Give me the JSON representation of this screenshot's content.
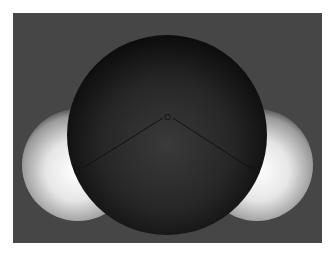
{
  "diagram": {
    "atoms": [
      {
        "id": "O",
        "label": "O",
        "element": "oxygen",
        "color": "#1a1a1a"
      },
      {
        "id": "H1",
        "label": "H",
        "element": "hydrogen",
        "color": "#f2f2f2"
      },
      {
        "id": "H2",
        "label": "H",
        "element": "hydrogen",
        "color": "#f2f2f2"
      }
    ],
    "bonds": [
      {
        "from": "O",
        "to": "H1"
      },
      {
        "from": "O",
        "to": "H2"
      }
    ],
    "background_color": "#464646"
  }
}
